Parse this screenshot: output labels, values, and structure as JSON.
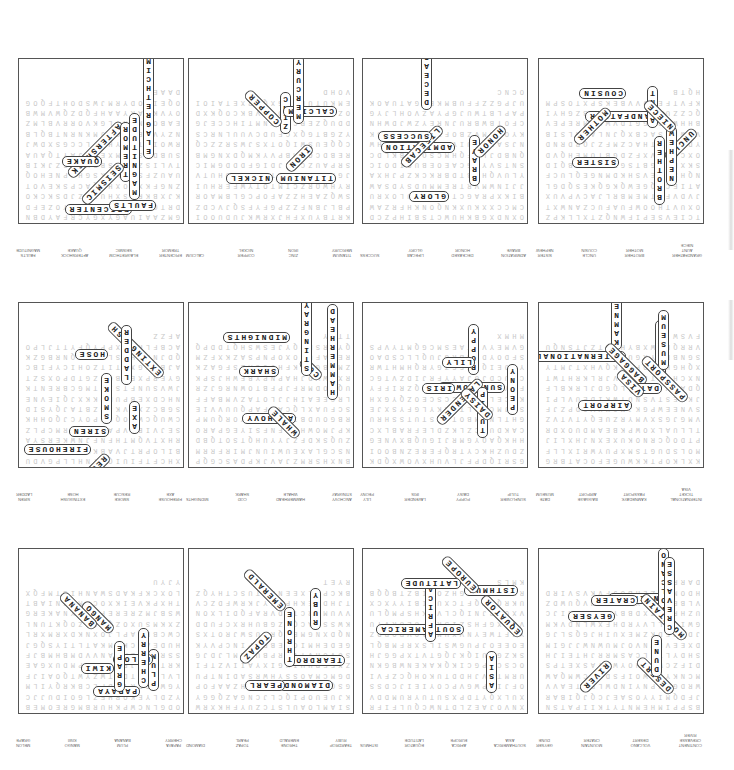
{
  "page": {
    "orientation": "rotated-180",
    "layout": {
      "rows": 3,
      "columns": 4
    },
    "puzzles": [
      {
        "id": 1,
        "found_words": [
          "CONTINENT",
          "VOLCANO",
          "MOUNTAIN",
          "GEYSER",
          "CREVASSE",
          "DESERT",
          "CRATER",
          "DUNE",
          "RIVER"
        ]
      },
      {
        "id": 2,
        "found_words": [
          "SOUTHAMERICA",
          "AFRICA",
          "EQUATOR",
          "ISTHMUS",
          "ASIA",
          "EUROPE",
          "LATITUDE"
        ]
      },
      {
        "id": 3,
        "found_words": [
          "TEARDROP",
          "THRONE",
          "TOPAZ",
          "DIAMOND",
          "RUBY",
          "EMERALD",
          "PEARL"
        ]
      },
      {
        "id": 4,
        "found_words": [
          "PAPAYA",
          "PLUM",
          "MANGO",
          "MELON",
          "CHERRY",
          "BANANA",
          "KIWI",
          "GRAPE"
        ]
      },
      {
        "id": 5,
        "found_words": [
          "INTERNATIONAL",
          "KAMNEDAYK",
          "BAGGAGE",
          "DATE",
          "TICKET",
          "PASSPORT",
          "AIRPORT",
          "MUSEUM",
          "VISA"
        ]
      },
      {
        "id": 6,
        "found_words": [
          "SUNFLOWER",
          "POPPY",
          "LAVENDER",
          "LILY",
          "TULIP",
          "DAISY",
          "IRIS",
          "PEONY"
        ]
      },
      {
        "id": 7,
        "found_words": [
          "ANCHOVY",
          "HAMMERHEAD",
          "COD",
          "MIDNIGHTS",
          "STINGRAY",
          "WHALE",
          "SHARK"
        ]
      },
      {
        "id": 8,
        "found_words": [
          "FIREHOUSE",
          "SMOKE",
          "EXTINGUISH",
          "SIREN",
          "AXE",
          "RESCUE",
          "HOSE",
          "LADDER"
        ]
      },
      {
        "id": 9,
        "found_words": [
          "GRANDFATHER",
          "BROTHER",
          "UNCLE",
          "SISTER",
          "AUNT",
          "MOTHER",
          "COUSIN",
          "NEPHEW",
          "NIECE"
        ]
      },
      {
        "id": 10,
        "found_words": [
          "ADMIRATION",
          "DECEASED",
          "LIFECAB",
          "SUCCESS",
          "BRAVE",
          "HONOR",
          "GLORY"
        ]
      },
      {
        "id": 11,
        "found_words": [
          "TITANIUM",
          "ZINC",
          "COPPER",
          "CALCIUM",
          "MERCURY",
          "IRON",
          "NICKEL"
        ]
      },
      {
        "id": 12,
        "found_words": [
          "EPICENTER",
          "ELAGRETHCIM",
          "AFTERSHOCK",
          "FAULTS",
          "TREMOR",
          "SEISMIC",
          "QUAKE",
          "MAGNITUDE"
        ]
      }
    ]
  }
}
